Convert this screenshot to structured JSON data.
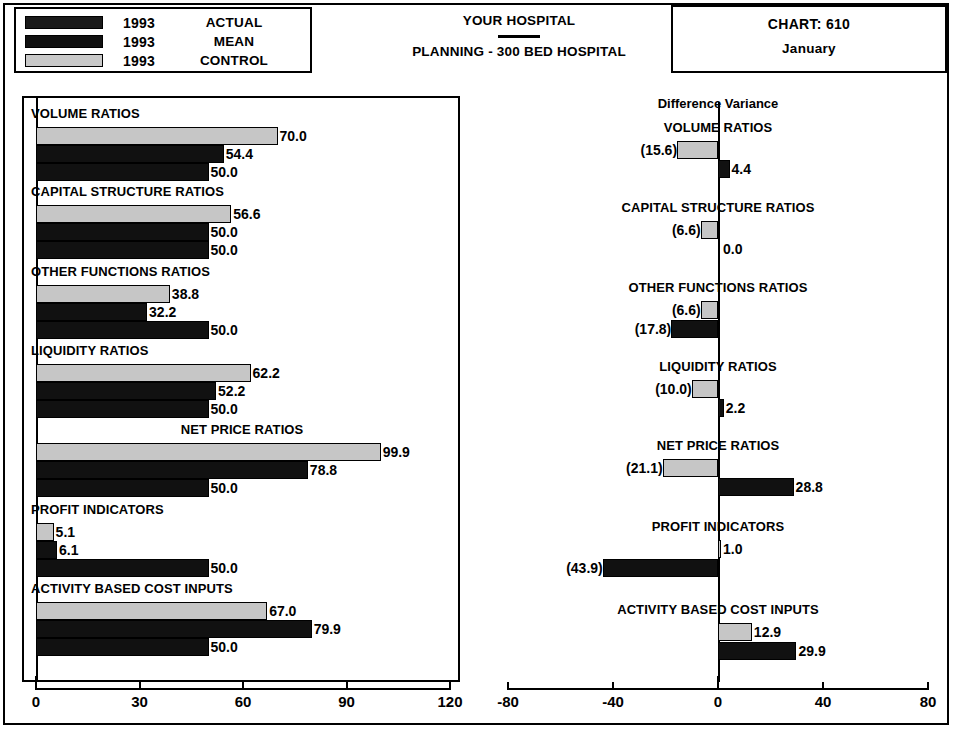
{
  "legend": {
    "rows": [
      {
        "year": "1993",
        "label": "ACTUAL",
        "swatch": "dark-textured"
      },
      {
        "year": "1993",
        "label": "MEAN",
        "swatch": "dark-solid"
      },
      {
        "year": "1993",
        "label": "CONTROL",
        "swatch": "light-gray"
      }
    ]
  },
  "header": {
    "hospital": "YOUR HOSPITAL",
    "subtitle": "PLANNING - 300 BED HOSPITAL",
    "chart_no": "CHART:  610",
    "month": "January"
  },
  "right_panel": {
    "heading": "Difference Variance"
  },
  "colors": {
    "dark": "#111111",
    "gray": "#c6c6c6",
    "frame": "#000000",
    "background": "#ffffff"
  },
  "chart_data": [
    {
      "type": "bar",
      "orientation": "horizontal",
      "title": "",
      "xlabel": "",
      "ylabel": "",
      "xlim": [
        0,
        120
      ],
      "xticks": [
        0,
        30,
        60,
        90,
        120
      ],
      "xticklabels": [
        "0",
        "30",
        "60",
        "90",
        "120"
      ],
      "grid": false,
      "legend": [
        "ACTUAL",
        "MEAN",
        "CONTROL"
      ],
      "legend_position": "top-left-external",
      "categories": [
        "VOLUME RATIOS",
        "CAPITAL STRUCTURE RATIOS",
        "OTHER FUNCTIONS RATIOS",
        "LIQUIDITY RATIOS",
        "NET PRICE RATIOS",
        "PROFIT INDICATORS",
        "ACTIVITY BASED COST INPUTS"
      ],
      "series": [
        {
          "name": "ACTUAL",
          "style": "gray",
          "values": [
            70.0,
            56.6,
            38.8,
            62.2,
            99.9,
            5.1,
            67.0
          ]
        },
        {
          "name": "MEAN",
          "style": "dark",
          "values": [
            54.4,
            50.0,
            32.2,
            52.2,
            78.8,
            6.1,
            79.9
          ]
        },
        {
          "name": "CONTROL",
          "style": "dark",
          "values": [
            50.0,
            50.0,
            50.0,
            50.0,
            50.0,
            50.0,
            50.0
          ]
        }
      ],
      "value_labels": [
        [
          "70.0",
          "54.4",
          "50.0"
        ],
        [
          "56.6",
          "50.0",
          "50.0"
        ],
        [
          "38.8",
          "32.2",
          "50.0"
        ],
        [
          "62.2",
          "52.2",
          "50.0"
        ],
        [
          "99.9",
          "78.8",
          "50.0"
        ],
        [
          "5.1",
          "6.1",
          "50.0"
        ],
        [
          "67.0",
          "79.9",
          "50.0"
        ]
      ]
    },
    {
      "type": "bar",
      "orientation": "horizontal",
      "title": "Difference Variance",
      "xlabel": "",
      "ylabel": "",
      "xlim": [
        -80,
        80
      ],
      "xticks": [
        -80,
        -40,
        0,
        40,
        80
      ],
      "xticklabels": [
        "-80",
        "-40",
        "0",
        "40",
        "80"
      ],
      "grid": false,
      "categories": [
        "VOLUME RATIOS",
        "CAPITAL STRUCTURE RATIOS",
        "OTHER FUNCTIONS RATIOS",
        "LIQUIDITY RATIOS",
        "NET PRICE RATIOS",
        "PROFIT INDICATORS",
        "ACTIVITY BASED COST INPUTS"
      ],
      "series": [
        {
          "name": "ACTUAL variance",
          "style": "gray",
          "values": [
            -15.6,
            -6.6,
            -6.6,
            -10.0,
            -21.1,
            1.0,
            12.9
          ]
        },
        {
          "name": "MEAN variance",
          "style": "dark",
          "values": [
            4.4,
            0.0,
            -17.8,
            2.2,
            28.8,
            -43.9,
            29.9
          ]
        }
      ],
      "value_labels": [
        [
          "(15.6)",
          "4.4"
        ],
        [
          "(6.6)",
          "0.0"
        ],
        [
          "(6.6)",
          "(17.8)"
        ],
        [
          "(10.0)",
          "2.2"
        ],
        [
          "(21.1)",
          "28.8"
        ],
        [
          "1.0",
          "(43.9)"
        ],
        [
          "12.9",
          "29.9"
        ]
      ]
    }
  ]
}
